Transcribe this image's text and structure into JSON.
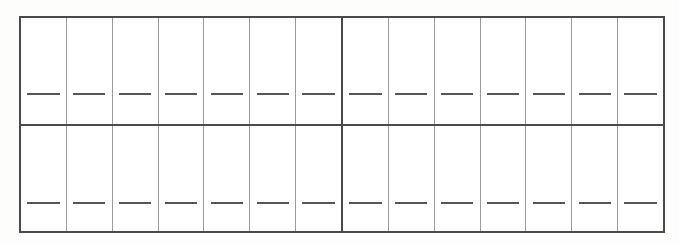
{
  "document": {
    "kind": "blank-worksheet-grid",
    "title": "",
    "background_color": "#fdfdfc",
    "paper_color": "#ffffff"
  },
  "grid": {
    "outer_border_color": "#4a4a4a",
    "outer_border_width_px": 2,
    "divider_color": "#4a4a4a",
    "divider_width_px": 2,
    "column_line_color": "#9b9b9b",
    "column_line_width_px": 1,
    "dash_color": "#55565a",
    "dash_width_px": 2,
    "rows": 2,
    "blocks_per_row": 2,
    "columns_per_block": 7,
    "total_columns": 14,
    "total_cells": 28,
    "bounds": {
      "left_px": 19,
      "top_px": 16,
      "width_px": 646,
      "height_px": 217
    },
    "bands": [
      {
        "name": "top-band",
        "blocks": [
          {
            "name": "top-left-block",
            "cells": [
              {
                "label": "",
                "dash": true
              },
              {
                "label": "",
                "dash": true
              },
              {
                "label": "",
                "dash": true
              },
              {
                "label": "",
                "dash": true
              },
              {
                "label": "",
                "dash": true
              },
              {
                "label": "",
                "dash": true
              },
              {
                "label": "",
                "dash": true
              }
            ]
          },
          {
            "name": "top-right-block",
            "cells": [
              {
                "label": "",
                "dash": true
              },
              {
                "label": "",
                "dash": true
              },
              {
                "label": "",
                "dash": true
              },
              {
                "label": "",
                "dash": true
              },
              {
                "label": "",
                "dash": true
              },
              {
                "label": "",
                "dash": true
              },
              {
                "label": "",
                "dash": true
              }
            ]
          }
        ]
      },
      {
        "name": "bottom-band",
        "blocks": [
          {
            "name": "bottom-left-block",
            "cells": [
              {
                "label": "",
                "dash": true
              },
              {
                "label": "",
                "dash": true
              },
              {
                "label": "",
                "dash": true
              },
              {
                "label": "",
                "dash": true
              },
              {
                "label": "",
                "dash": true
              },
              {
                "label": "",
                "dash": true
              },
              {
                "label": "",
                "dash": true
              }
            ]
          },
          {
            "name": "bottom-right-block",
            "cells": [
              {
                "label": "",
                "dash": true
              },
              {
                "label": "",
                "dash": true
              },
              {
                "label": "",
                "dash": true
              },
              {
                "label": "",
                "dash": true
              },
              {
                "label": "",
                "dash": true
              },
              {
                "label": "",
                "dash": true
              },
              {
                "label": "",
                "dash": true
              }
            ]
          }
        ]
      }
    ]
  }
}
